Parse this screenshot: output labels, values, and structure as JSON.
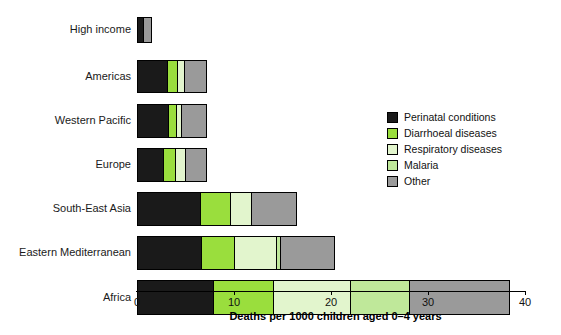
{
  "chart_data": {
    "type": "bar",
    "orientation": "horizontal",
    "stacked": true,
    "title": "",
    "xlabel": "Deaths per 1000 children aged 0–4 years",
    "ylabel": "",
    "xlim": [
      0,
      40
    ],
    "xticks": [
      0,
      10,
      20,
      30,
      40
    ],
    "xticklabels": [
      "0",
      "10",
      "20",
      "30",
      "40"
    ],
    "grid": false,
    "legend_position": "right",
    "categories": [
      "High income",
      "Americas",
      "Western Pacific",
      "Europe",
      "South-East Asia",
      "Eastern Mediterranean",
      "Africa"
    ],
    "series": [
      {
        "name": "Perinatal conditions",
        "color": "#1a1a1a",
        "values": [
          0.6,
          3.1,
          3.2,
          2.7,
          6.5,
          6.6,
          7.8
        ]
      },
      {
        "name": "Diarrhoeal diseases",
        "color": "#9ade3d",
        "values": [
          0.0,
          1.0,
          0.8,
          1.2,
          3.1,
          3.4,
          6.2
        ]
      },
      {
        "name": "Respiratory diseases",
        "color": "#e2f5cd",
        "values": [
          0.0,
          0.7,
          0.5,
          1.0,
          2.2,
          4.3,
          8.0
        ]
      },
      {
        "name": "Malaria",
        "color": "#bfe89a",
        "values": [
          0.0,
          0.0,
          0.0,
          0.0,
          0.0,
          0.4,
          6.0
        ]
      },
      {
        "name": "Other",
        "color": "#9a9a9a",
        "values": [
          0.9,
          2.4,
          2.7,
          2.3,
          4.7,
          5.7,
          10.5
        ]
      }
    ],
    "totals": [
      1.5,
      7.2,
      7.2,
      7.2,
      16.5,
      20.4,
      38.5
    ]
  },
  "legend": {
    "items": [
      {
        "label": "Perinatal conditions",
        "color": "#1a1a1a"
      },
      {
        "label": "Diarrhoeal diseases",
        "color": "#9ade3d"
      },
      {
        "label": "Respiratory diseases",
        "color": "#e2f5cd"
      },
      {
        "label": "Malaria",
        "color": "#bfe89a"
      },
      {
        "label": "Other",
        "color": "#9a9a9a"
      }
    ]
  }
}
